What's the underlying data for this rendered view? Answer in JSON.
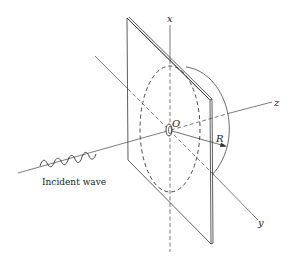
{
  "figure": {
    "labels": {
      "x_axis": "x",
      "y_axis": "y",
      "z_axis": "z",
      "origin": "O",
      "radius": "R",
      "incident_wave": "Incident wave"
    },
    "colors": {
      "line": "#333333",
      "background": "#ffffff"
    }
  }
}
